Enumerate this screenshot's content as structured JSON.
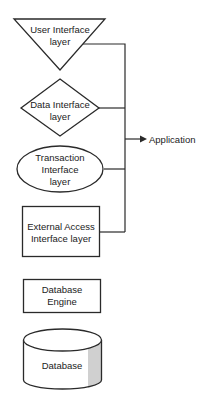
{
  "diagram": {
    "nodes": [
      {
        "id": "ui",
        "shape": "inverted-triangle",
        "lines": [
          "User Interface",
          "layer"
        ]
      },
      {
        "id": "data",
        "shape": "diamond",
        "lines": [
          "Data Interface",
          "layer"
        ]
      },
      {
        "id": "txn",
        "shape": "ellipse",
        "lines": [
          "Transaction",
          "Interface",
          "layer"
        ]
      },
      {
        "id": "ext",
        "shape": "rectangle",
        "lines": [
          "External Access",
          "Interface layer"
        ]
      },
      {
        "id": "engine",
        "shape": "rectangle",
        "lines": [
          "Database",
          "Engine"
        ]
      },
      {
        "id": "db",
        "shape": "cylinder",
        "lines": [
          "Database"
        ]
      }
    ],
    "target": {
      "label": "Application"
    },
    "edges": [
      {
        "from": "ui",
        "to": "Application"
      },
      {
        "from": "data",
        "to": "Application"
      },
      {
        "from": "txn",
        "to": "Application"
      },
      {
        "from": "ext",
        "to": "Application"
      }
    ],
    "colors": {
      "stroke": "#2a2a2a",
      "fill": "#ffffff",
      "shade": "#d0d0d0",
      "text": "#222222"
    }
  }
}
